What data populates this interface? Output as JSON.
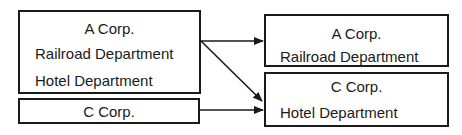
{
  "diagram": {
    "left": {
      "box_a": {
        "title": "A Corp.",
        "lines": [
          "Railroad Department",
          "Hotel Department"
        ]
      },
      "box_c": {
        "title": "C Corp."
      }
    },
    "right": {
      "box_a": {
        "title": "A Corp.",
        "lines": [
          "Railroad Department"
        ]
      },
      "box_c": {
        "title": "C Corp.",
        "lines": [
          "Hotel Department"
        ]
      }
    },
    "arrows": [
      {
        "from": "left A Corp.",
        "to": "right A Corp. (Railroad Department)"
      },
      {
        "from": "left A Corp.",
        "to": "right C Corp. (Hotel Department)"
      },
      {
        "from": "left C Corp.",
        "to": "right C Corp."
      }
    ],
    "colors": {
      "line": "#1a1a1a",
      "background": "#ffffff"
    }
  }
}
